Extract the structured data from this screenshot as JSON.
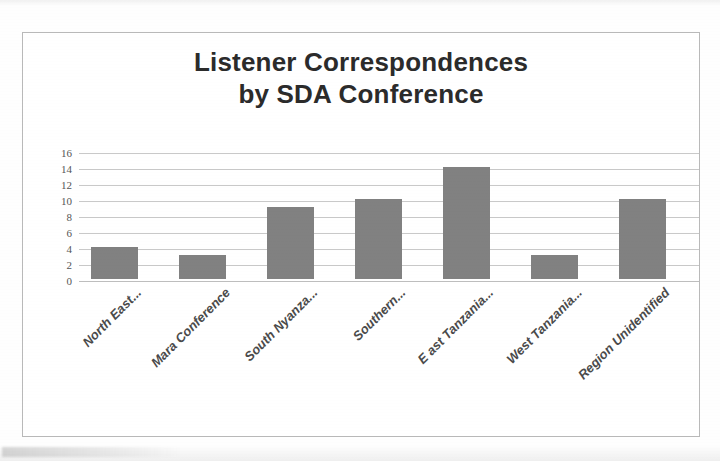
{
  "document": {
    "type": "scanned-figure",
    "background_color": "#ffffff",
    "frame_color": "#b9b9b9"
  },
  "chart_data": {
    "type": "bar",
    "title": "Listener Correspondences by SDA Conference",
    "title_lines": [
      "Listener Correspondences",
      "by SDA Conference"
    ],
    "xlabel": "",
    "ylabel": "",
    "categories": [
      "North East...",
      "Mara Conference",
      "South Nyanza...",
      "Southern...",
      "E ast Tanzania...",
      "West Tanzania...",
      "Region Unidentified"
    ],
    "values": [
      4,
      3,
      9,
      10,
      14,
      3,
      10
    ],
    "ylim": [
      0,
      16
    ],
    "ytick_step": 2,
    "yticks": [
      16,
      14,
      12,
      10,
      8,
      6,
      4,
      2,
      0
    ],
    "grid": true,
    "grid_axis": "y",
    "legend": false,
    "legend_position": "none",
    "bar_color": "#818181",
    "gridline_color": "#c9c9c9",
    "title_color": "#2b2b2b",
    "tick_label_color": "#555555",
    "category_label_rotation": -45
  }
}
